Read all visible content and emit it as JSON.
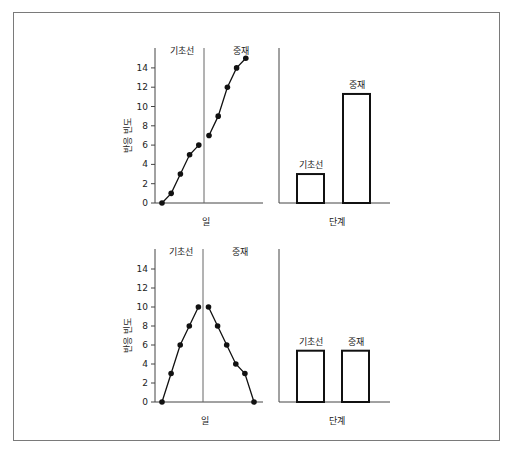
{
  "chart_data": [
    {
      "type": "line",
      "title": "",
      "xlabel": "일",
      "ylabel": "반응 빈도",
      "ylim": [
        0,
        15
      ],
      "yticks": [
        0,
        2,
        4,
        6,
        8,
        10,
        12,
        14
      ],
      "phase_labels": [
        "기초선",
        "중재"
      ],
      "series": [
        {
          "name": "기초선",
          "x": [
            1,
            2,
            3,
            4,
            5
          ],
          "values": [
            0,
            1,
            3,
            5,
            6
          ]
        },
        {
          "name": "중재",
          "x": [
            6,
            7,
            8,
            9,
            10
          ],
          "values": [
            7,
            9,
            12,
            14,
            15
          ]
        }
      ]
    },
    {
      "type": "bar",
      "title": "",
      "xlabel": "단계",
      "ylabel": "",
      "categories": [
        "기초선",
        "중재"
      ],
      "values": [
        3,
        11.3
      ],
      "ylim": [
        0,
        15
      ]
    },
    {
      "type": "line",
      "title": "",
      "xlabel": "일",
      "ylabel": "반응 빈도",
      "ylim": [
        0,
        15
      ],
      "yticks": [
        0,
        2,
        4,
        6,
        8,
        10,
        12,
        14
      ],
      "phase_labels": [
        "기초선",
        "중재"
      ],
      "series": [
        {
          "name": "기초선",
          "x": [
            1,
            2,
            3,
            4,
            5
          ],
          "values": [
            0,
            3,
            6,
            8,
            10
          ]
        },
        {
          "name": "중재",
          "x": [
            6,
            7,
            8,
            9,
            10,
            11
          ],
          "values": [
            10,
            8,
            6,
            4,
            3,
            0
          ]
        }
      ]
    },
    {
      "type": "bar",
      "title": "",
      "xlabel": "단계",
      "ylabel": "",
      "categories": [
        "기초선",
        "중재"
      ],
      "values": [
        5.4,
        5.4
      ],
      "ylim": [
        0,
        15
      ]
    }
  ],
  "labels": {
    "baseline": "기초선",
    "intervention": "중재",
    "day": "일",
    "phase": "단계",
    "ylabel": "반응 빈도"
  }
}
